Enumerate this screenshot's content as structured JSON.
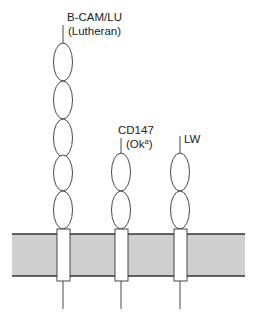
{
  "diagram": {
    "type": "membrane-protein-schematic",
    "colors": {
      "membrane_fill": "#cfcfcf",
      "membrane_edge": "#333333",
      "stroke": "#333333",
      "background": "#ffffff"
    },
    "membrane": {
      "x1": 12,
      "x2": 245,
      "top": 234,
      "bottom": 276
    },
    "proteins": [
      {
        "name": "B-CAM/LU",
        "label_line1": "B-CAM/LU",
        "label_line2": "(Lutheran)",
        "center_x": 63,
        "domains": 5
      },
      {
        "name": "CD147",
        "label_line1": "CD147",
        "label_line2_prefix": "(Ok",
        "label_line2_sup": "a",
        "label_line2_suffix": ")",
        "center_x": 121,
        "domains": 2
      },
      {
        "name": "LW",
        "label_line1": "LW",
        "center_x": 180,
        "domains": 2
      }
    ]
  }
}
